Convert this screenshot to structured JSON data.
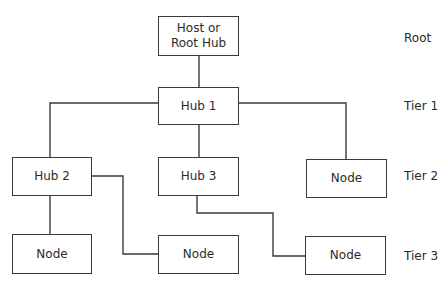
{
  "diagram": {
    "nodes": {
      "root": {
        "label": "Host or\nRoot Hub"
      },
      "hub1": {
        "label": "Hub 1"
      },
      "hub2": {
        "label": "Hub 2"
      },
      "hub3": {
        "label": "Hub 3"
      },
      "tier2_node": {
        "label": "Node"
      },
      "tier3_node_left": {
        "label": "Node"
      },
      "tier3_node_middle": {
        "label": "Node"
      },
      "tier3_node_right": {
        "label": "Node"
      }
    },
    "edges": [
      {
        "from": "root",
        "to": "hub1"
      },
      {
        "from": "hub1",
        "to": "hub2"
      },
      {
        "from": "hub1",
        "to": "hub3"
      },
      {
        "from": "hub1",
        "to": "tier2_node"
      },
      {
        "from": "hub2",
        "to": "tier3_node_left"
      },
      {
        "from": "hub2",
        "to": "tier3_node_middle"
      },
      {
        "from": "hub3",
        "to": "tier3_node_right"
      }
    ],
    "tiers": [
      {
        "label": "Root"
      },
      {
        "label": "Tier 1"
      },
      {
        "label": "Tier 2"
      },
      {
        "label": "Tier 3"
      }
    ],
    "colors": {
      "line": "#3a3a3a",
      "text": "#2b2b2b",
      "background": "#ffffff"
    }
  }
}
